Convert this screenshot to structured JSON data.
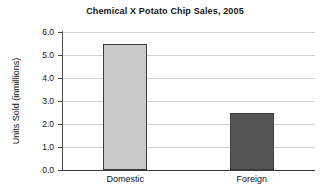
{
  "chart_data": {
    "type": "bar",
    "title": "Chemical X Potato Chip Sales, 2005",
    "xlabel": "",
    "ylabel": "Units Sold (inmillions)",
    "categories": [
      "Domestic",
      "Foreign"
    ],
    "values": [
      5.5,
      2.5
    ],
    "ylim": [
      0.0,
      6.0
    ],
    "ytick_labels": [
      "6.0",
      "5.0",
      "4.0",
      "3.0",
      "2.0",
      "1.0",
      "0.0"
    ],
    "ytick_values": [
      6.0,
      5.0,
      4.0,
      3.0,
      2.0,
      1.0,
      0.0
    ],
    "grid": true,
    "legend": false,
    "bar_colors": [
      "#c9c9c9",
      "#555555"
    ],
    "bar_edge_color": "#3c3c3c",
    "gridline_color": "#d2d2d2",
    "axis_color": "#4a4a4a",
    "text_color": "#141414",
    "background": "#ffffff"
  }
}
